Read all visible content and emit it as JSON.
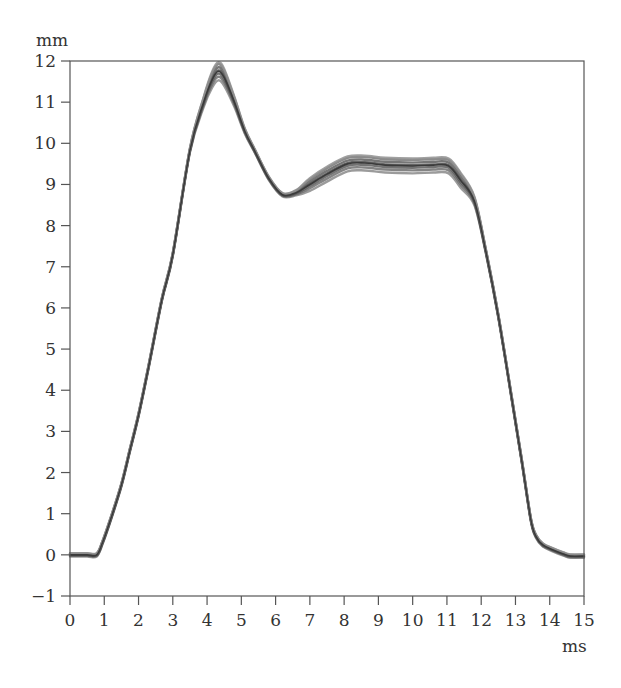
{
  "chart_data": {
    "type": "line",
    "title": "",
    "xlabel": "ms",
    "ylabel": "mm",
    "xlim": [
      0,
      15
    ],
    "ylim": [
      -1,
      12
    ],
    "grid": false,
    "legend": null,
    "x_ticks": [
      0,
      1,
      2,
      3,
      4,
      5,
      6,
      7,
      8,
      9,
      10,
      11,
      12,
      13,
      14,
      15
    ],
    "y_ticks": [
      -1,
      0,
      1,
      2,
      3,
      4,
      5,
      6,
      7,
      8,
      9,
      10,
      11,
      12
    ],
    "x_tick_labels": [
      "0",
      "1",
      "2",
      "3",
      "4",
      "5",
      "6",
      "7",
      "8",
      "9",
      "10",
      "11",
      "12",
      "13",
      "14",
      "15"
    ],
    "y_tick_labels": [
      "−1",
      "0",
      "1",
      "2",
      "3",
      "4",
      "5",
      "6",
      "7",
      "8",
      "9",
      "10",
      "11",
      "12"
    ],
    "series": [
      {
        "name": "displacement (overlaid traces, mean)",
        "color": "#555555",
        "x": [
          0,
          0.5,
          0.78,
          0.95,
          1.2,
          1.5,
          1.75,
          2.0,
          2.3,
          2.68,
          3.0,
          3.5,
          3.9,
          4.15,
          4.33,
          4.5,
          4.8,
          5.1,
          5.4,
          5.8,
          6.2,
          6.6,
          7.0,
          7.5,
          8.1,
          8.6,
          9.2,
          10.0,
          10.6,
          11.05,
          11.4,
          11.8,
          12.13,
          12.5,
          12.9,
          13.2,
          13.45,
          13.6,
          13.8,
          14.1,
          14.4,
          14.6,
          15.0
        ],
        "values": [
          0,
          0,
          0,
          0.3,
          0.9,
          1.7,
          2.55,
          3.4,
          4.6,
          6.2,
          7.3,
          9.83,
          11.0,
          11.55,
          11.75,
          11.6,
          11.0,
          10.3,
          9.8,
          9.15,
          8.75,
          8.8,
          9.0,
          9.25,
          9.5,
          9.52,
          9.47,
          9.45,
          9.47,
          9.45,
          9.1,
          8.6,
          7.4,
          5.8,
          3.76,
          2.2,
          0.85,
          0.45,
          0.24,
          0.12,
          0.02,
          -0.03,
          -0.03
        ]
      }
    ],
    "annotations": []
  },
  "axes": {
    "y_unit": "mm",
    "x_unit": "ms"
  }
}
